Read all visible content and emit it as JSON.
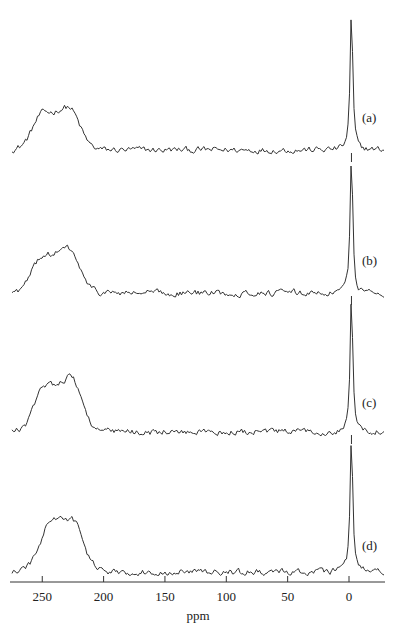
{
  "chart_data": {
    "type": "line",
    "title": "",
    "xlabel": "ppm",
    "ylabel": "",
    "xlim": [
      272,
      -30
    ],
    "x_reversed": true,
    "grid": false,
    "legend": "none",
    "xticks": [
      250,
      200,
      150,
      100,
      50,
      0
    ],
    "xtick_labels": [
      "250",
      "200",
      "150",
      "100",
      "50",
      "0"
    ],
    "series": [
      {
        "name": "(a)",
        "baseline_offset": 150,
        "broad_peak": {
          "center_ppm": 229,
          "height": 43,
          "left_shoulder_ppm": 252
        },
        "sharp_peak": {
          "center_ppm": -2,
          "height": 138
        }
      },
      {
        "name": "(b)",
        "baseline_offset": 293,
        "broad_peak": {
          "center_ppm": 229,
          "height": 44,
          "left_shoulder_ppm": 252
        },
        "sharp_peak": {
          "center_ppm": -2,
          "height": 137
        }
      },
      {
        "name": "(c)",
        "baseline_offset": 432,
        "broad_peak": {
          "center_ppm": 227,
          "height": 55,
          "left_shoulder_ppm": 250
        },
        "sharp_peak": {
          "center_ppm": -2,
          "height": 137
        }
      },
      {
        "name": "(d)",
        "baseline_offset": 572,
        "broad_peak": {
          "center_ppm": 226,
          "height": 52,
          "left_shoulder_ppm": 245
        },
        "sharp_peak": {
          "center_ppm": -2,
          "height": 137
        }
      }
    ],
    "annotations": [
      "(a)",
      "(b)",
      "(c)",
      "(d)"
    ]
  },
  "labels": {
    "panels": [
      "(a)",
      "(b)",
      "(c)",
      "(d)"
    ],
    "xlabel": "ppm",
    "ticks": [
      "250",
      "200",
      "150",
      "100",
      "50",
      "0"
    ]
  }
}
